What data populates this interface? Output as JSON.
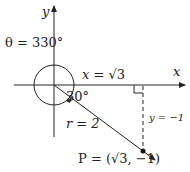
{
  "diagram": {
    "axes": {
      "x_label": "x",
      "y_label": "y"
    },
    "angle_label": "θ = 330°",
    "reference_angle": "30°",
    "x_coord": {
      "var": "x",
      "eq": " = ",
      "root": "√3"
    },
    "y_coord": {
      "text": "y = −1"
    },
    "radius_label": "r = 2",
    "point_label": "P = (√3, −1)",
    "colors": {
      "line": "#222222"
    }
  }
}
